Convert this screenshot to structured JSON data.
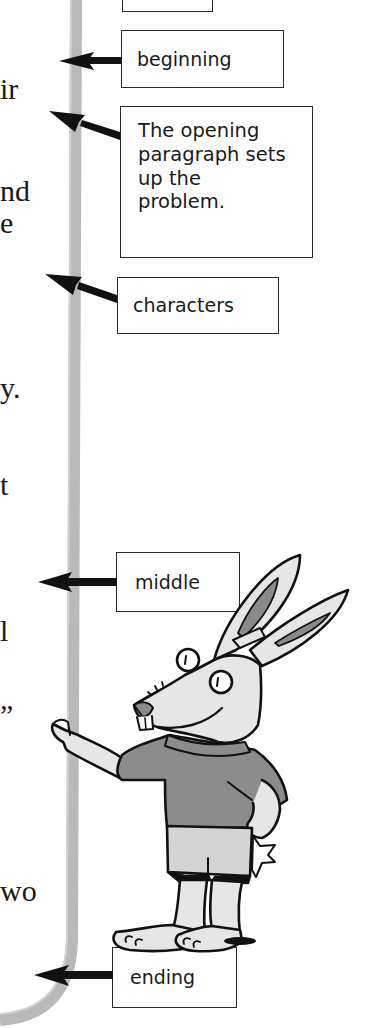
{
  "page": {
    "text_fragments": [
      "ir",
      "nd",
      "e",
      "y.",
      "t",
      "l",
      "”",
      "wo"
    ],
    "callouts": {
      "top_box": "",
      "beginning": "beginning",
      "opening_paragraph": "The opening paragraph sets up the problem.",
      "characters": "characters",
      "middle": "middle",
      "ending": "ending"
    },
    "illustration": "rabbit-character",
    "colors": {
      "margin_bar": "#b9b9b9",
      "rabbit_fur": "#e6e6e6",
      "shirt": "#8c8c8c",
      "shorts": "#d4d4d4",
      "ear_inner": "#8a8a8a",
      "outline": "#111111"
    }
  }
}
